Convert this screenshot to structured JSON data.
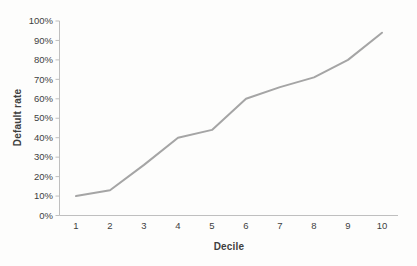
{
  "chart_data": {
    "type": "line",
    "title": "",
    "categories": [
      "1",
      "2",
      "3",
      "4",
      "5",
      "6",
      "7",
      "8",
      "9",
      "10"
    ],
    "values": [
      10,
      13,
      26,
      40,
      44,
      60,
      66,
      71,
      80,
      94
    ],
    "xlabel": "Decile",
    "ylabel": "Default rate",
    "ylim": [
      0,
      100
    ],
    "y_tick_step": 10,
    "y_tick_labels": [
      "0%",
      "10%",
      "20%",
      "30%",
      "40%",
      "50%",
      "60%",
      "70%",
      "80%",
      "90%",
      "100%"
    ],
    "grid": false,
    "legend": "none",
    "line_color": "#a5a5a5",
    "axis_color": "#bfbfbf",
    "text_color": "#3f3f3f"
  }
}
